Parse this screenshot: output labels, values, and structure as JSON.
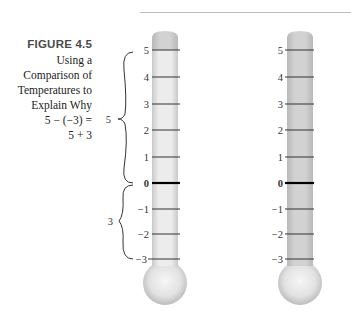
{
  "figure": {
    "label": "FIGURE 4.5",
    "caption_lines": [
      "Using a",
      "Comparison of",
      "Temperatures to",
      "Explain Why",
      "5 − (−3) =",
      "5 + 3"
    ]
  },
  "thermometers": [
    {
      "name": "left",
      "ticks": [
        "5",
        "4",
        "3",
        "2",
        "1",
        "0",
        "−1",
        "−2",
        "−3"
      ],
      "fill": "partial (top cap shaded above 5, light tube below)",
      "braces": [
        {
          "label": "5",
          "from": "0",
          "to": "5"
        },
        {
          "label": "3",
          "from": "−3",
          "to": "0"
        }
      ]
    },
    {
      "name": "right",
      "ticks": [
        "5",
        "4",
        "3",
        "2",
        "1",
        "0",
        "−1",
        "−2",
        "−3"
      ],
      "fill": "full"
    }
  ],
  "colors": {
    "tube_fill": "#cfcfcf",
    "tube_light": "#ececec",
    "tick": "#333333",
    "zero_tick": "#000000"
  }
}
